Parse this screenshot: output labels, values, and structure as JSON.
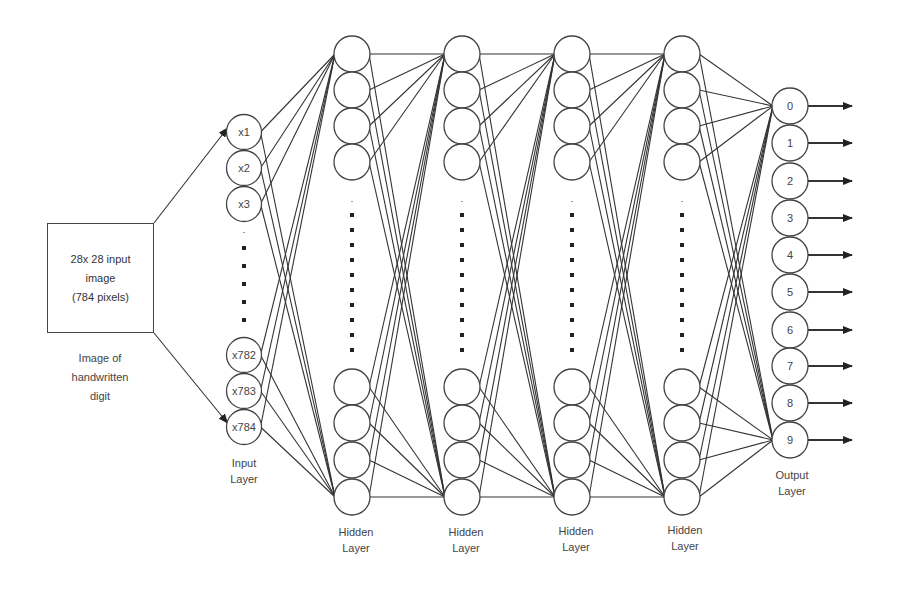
{
  "input_box": {
    "lines": [
      "28x 28 input",
      "image",
      "(784 pixels)"
    ],
    "caption": [
      "Image of",
      "handwritten",
      "digit"
    ]
  },
  "input_layer": {
    "nodes_top": [
      "x1",
      "x2",
      "x3"
    ],
    "nodes_bottom": [
      "x782",
      "x783",
      "x784"
    ],
    "label": [
      "Input",
      "Layer"
    ]
  },
  "hidden_layers": [
    {
      "label": [
        "Hidden",
        "Layer"
      ]
    },
    {
      "label": [
        "Hidden",
        "Layer"
      ]
    },
    {
      "label": [
        "Hidden",
        "Layer"
      ]
    },
    {
      "label": [
        "Hidden",
        "Layer"
      ]
    }
  ],
  "output_layer": {
    "nodes": [
      "0",
      "1",
      "2",
      "3",
      "4",
      "5",
      "6",
      "7",
      "8",
      "9"
    ],
    "label": [
      "Output",
      "Layer"
    ]
  },
  "colors": {
    "stroke": "#333333",
    "text": "#444444",
    "background": "#ffffff"
  }
}
